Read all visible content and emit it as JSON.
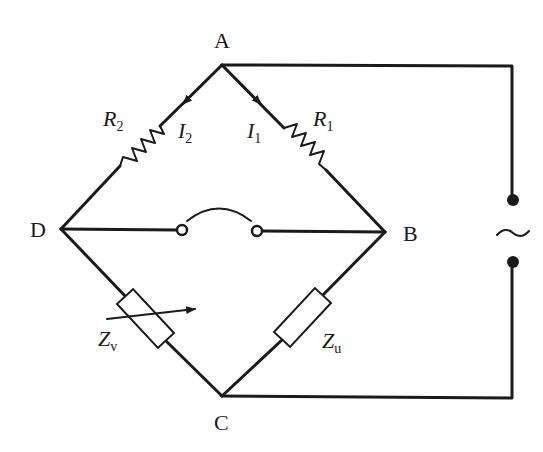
{
  "diagram": {
    "type": "AC impedance bridge circuit",
    "colors": {
      "line": "#1a1a1a",
      "background": "#ffffff"
    },
    "nodes": {
      "A": {
        "label": "A"
      },
      "B": {
        "label": "B"
      },
      "C": {
        "label": "C"
      },
      "D": {
        "label": "D"
      }
    },
    "components": {
      "R1": {
        "symbol": "R",
        "subscript": "1",
        "branch": "A-B",
        "kind": "resistor"
      },
      "R2": {
        "symbol": "R",
        "subscript": "2",
        "branch": "A-D",
        "kind": "resistor"
      },
      "Zu": {
        "symbol": "Z",
        "subscript": "u",
        "branch": "B-C",
        "kind": "impedance"
      },
      "Zv": {
        "symbol": "Z",
        "subscript": "v",
        "branch": "D-C",
        "kind": "variable-impedance"
      },
      "detector": {
        "kind": "switch/detector",
        "branch": "D-B"
      },
      "source": {
        "symbol": "~",
        "kind": "AC source",
        "branch": "A-C"
      }
    },
    "currents": {
      "I1": {
        "symbol": "I",
        "subscript": "1",
        "direction": "A→B"
      },
      "I2": {
        "symbol": "I",
        "subscript": "2",
        "direction": "A→D"
      }
    }
  }
}
